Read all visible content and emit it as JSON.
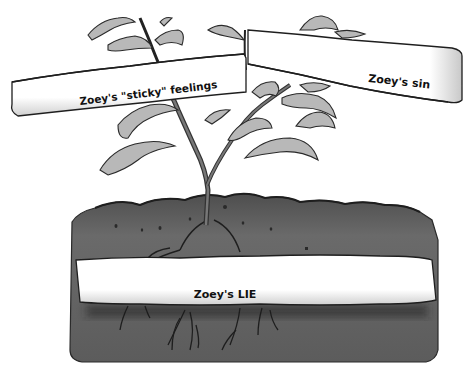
{
  "illustration": {
    "subject": "tree-with-root-diagram",
    "labels": {
      "feelings": "Zoey's \"sticky\" feelings",
      "sin": "Zoey's sin",
      "lie": "Zoey's LIE"
    },
    "colors": {
      "background": "#ffffff",
      "soil_dark": "#5a5a5a",
      "soil_mid": "#6e6e6e",
      "soil_top": "#4a4a4a",
      "leaf_fill": "#b5b5b5",
      "leaf_dark": "#8a8a8a",
      "stem": "#555555",
      "outline": "#222222",
      "banner_fill": "#ffffff",
      "banner_shade": "#d8d8d8",
      "text": "#111111"
    }
  }
}
